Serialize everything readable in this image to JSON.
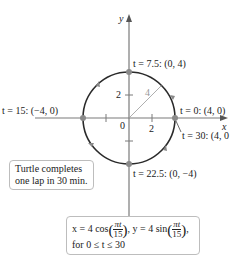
{
  "diagram": {
    "axes": {
      "x_label": "x",
      "y_label": "y",
      "origin_label": "0",
      "x_tick_label": "2",
      "y_tick_label": "2"
    },
    "circle": {
      "radius_label": "4",
      "center": [
        0,
        0
      ],
      "radius": 4
    },
    "points": [
      {
        "id": "p0",
        "t": "0",
        "label": "t = 0: (4, 0)"
      },
      {
        "id": "p75",
        "t": "7.5",
        "label": "t = 7.5: (0, 4)"
      },
      {
        "id": "p15",
        "t": "15",
        "label": "t = 15: (−4, 0)"
      },
      {
        "id": "p225",
        "t": "22.5",
        "label": "t = 22.5: (0, −4)"
      },
      {
        "id": "p30",
        "t": "30",
        "label": "t = 30: (4, 0"
      }
    ],
    "note": {
      "line1": "Turtle completes",
      "line2": "one lap in 30 min."
    },
    "equation": {
      "x_part": "x = 4 cos",
      "y_part": ", y = 4 sin",
      "frac_num": "πt",
      "frac_den": "15",
      "domain": "for 0 ≤ t ≤ 30"
    },
    "colors": {
      "axis": "#7a7a7a",
      "circle": "#2a2a2a",
      "point": "#8a8a8a",
      "radius": "#9a9a9a"
    }
  }
}
